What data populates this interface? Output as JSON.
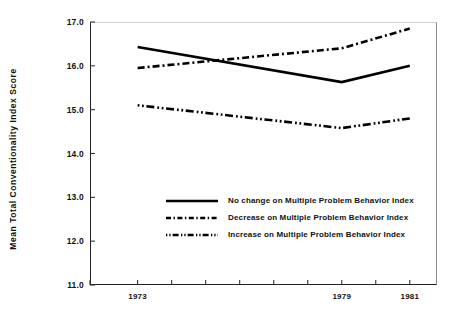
{
  "chart_data": {
    "type": "line",
    "title": "",
    "xlabel": "",
    "ylabel": "Mean Total Conventionality Index Score",
    "x": [
      1973,
      1979,
      1981
    ],
    "xlim": [
      1971.6,
      1981.8
    ],
    "ylim": [
      11.0,
      17.0
    ],
    "yticks": [
      "17.0",
      "16.0",
      "15.0",
      "14.0",
      "13.0",
      "12.0",
      "11.0"
    ],
    "ytick_values": [
      17.0,
      16.0,
      15.0,
      14.0,
      13.0,
      12.0,
      11.0
    ],
    "xticks_labeled": [
      "1973",
      "1979",
      "1981"
    ],
    "xtick_positions_all": [
      1971.6,
      1973.0,
      1974.0,
      1975.0,
      1976.0,
      1977.0,
      1978.0,
      1979.0,
      1980.0,
      1981.0
    ],
    "grid": false,
    "legend_position": "center-left",
    "series": [
      {
        "name": "No change on Multiple Problem Behavior Index",
        "style": "solid",
        "values": [
          16.43,
          15.63,
          16.0
        ]
      },
      {
        "name": "Decrease on Multiple Problem Behavior Index",
        "style": "dash-dot",
        "values": [
          15.95,
          16.4,
          16.85
        ]
      },
      {
        "name": "Increase on Multiple Problem Behavior Index",
        "style": "dot-dot-dash",
        "values": [
          15.1,
          14.58,
          14.8
        ]
      }
    ]
  },
  "axis": {
    "y_label": "Mean Total Conventionality Index Score"
  },
  "legend": {
    "items": [
      {
        "label": "No change on Multiple Problem Behavior Index"
      },
      {
        "label": "Decrease on Multiple Problem Behavior Index"
      },
      {
        "label": "Increase on Multiple Problem Behavior Index"
      }
    ]
  }
}
